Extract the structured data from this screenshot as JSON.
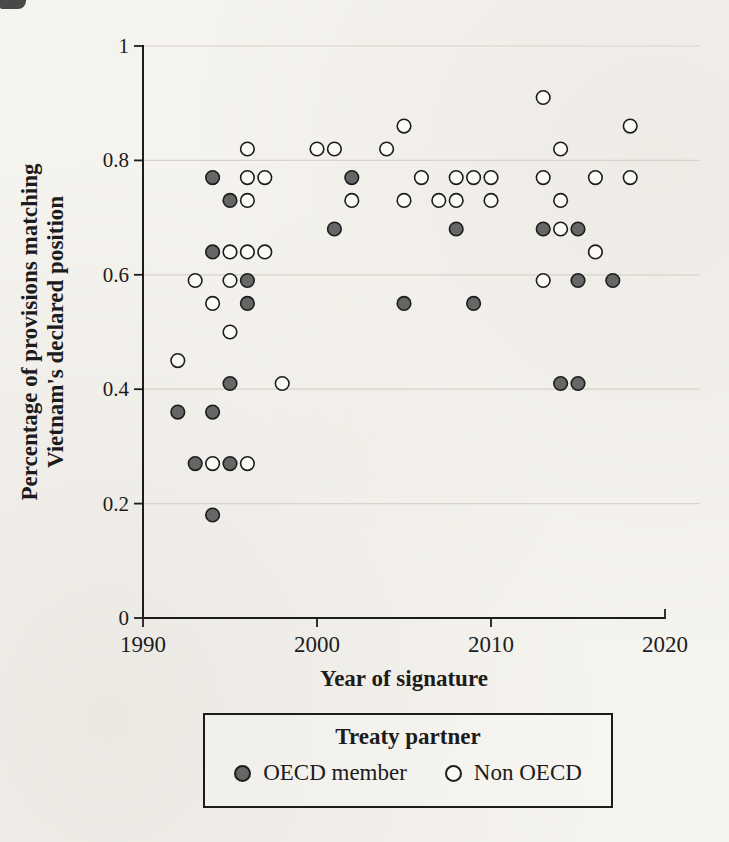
{
  "figure": {
    "background": "#f5f3ee",
    "ink": "#1c1c1c",
    "grid_color": "#d7d4cd",
    "marker_outline": "#1c1c1c"
  },
  "chart_data": {
    "type": "scatter",
    "title": "",
    "xlabel": "Year of signature",
    "ylabel_line1": "Percentage of provisions matching",
    "ylabel_line2": "Vietnam's declared position",
    "xlim": [
      1990,
      2020
    ],
    "ylim": [
      0,
      1
    ],
    "x_ticks": [
      1990,
      2000,
      2010,
      2020
    ],
    "x_tick_labels": [
      "1990",
      "2000",
      "2010",
      "2020"
    ],
    "y_ticks": [
      0,
      0.2,
      0.4,
      0.6,
      0.8,
      1
    ],
    "y_tick_labels": [
      "0",
      "0.2",
      "0.4",
      "0.6",
      "0.8",
      "1"
    ],
    "grid": "horizontal-only",
    "legend": {
      "title": "Treaty partner",
      "position": "below-chart",
      "entries": [
        {
          "label": "OECD member",
          "marker": "filled-circle",
          "fill": "#666666"
        },
        {
          "label": "Non OECD",
          "marker": "open-circle",
          "fill": "#fbfaf6"
        }
      ]
    },
    "series": [
      {
        "name": "OECD member",
        "marker": "filled-circle",
        "marker_fill": "#666666",
        "points": [
          [
            1992,
            0.36
          ],
          [
            1993,
            0.27
          ],
          [
            1994,
            0.77
          ],
          [
            1994,
            0.64
          ],
          [
            1994,
            0.36
          ],
          [
            1994,
            0.18
          ],
          [
            1995,
            0.73
          ],
          [
            1995,
            0.41
          ],
          [
            1995,
            0.27
          ],
          [
            1996,
            0.59
          ],
          [
            1996,
            0.55
          ],
          [
            2001,
            0.68
          ],
          [
            2002,
            0.77
          ],
          [
            2005,
            0.55
          ],
          [
            2008,
            0.68
          ],
          [
            2009,
            0.55
          ],
          [
            2013,
            0.68
          ],
          [
            2014,
            0.41
          ],
          [
            2015,
            0.68
          ],
          [
            2015,
            0.59
          ],
          [
            2015,
            0.41
          ],
          [
            2017,
            0.59
          ]
        ]
      },
      {
        "name": "Non OECD",
        "marker": "open-circle",
        "marker_fill": "#fbfaf6",
        "points": [
          [
            1992,
            0.45
          ],
          [
            1993,
            0.59
          ],
          [
            1994,
            0.55
          ],
          [
            1994,
            0.27
          ],
          [
            1995,
            0.64
          ],
          [
            1995,
            0.59
          ],
          [
            1995,
            0.5
          ],
          [
            1996,
            0.82
          ],
          [
            1996,
            0.77
          ],
          [
            1996,
            0.73
          ],
          [
            1996,
            0.64
          ],
          [
            1996,
            0.27
          ],
          [
            1997,
            0.77
          ],
          [
            1997,
            0.64
          ],
          [
            1998,
            0.41
          ],
          [
            2000,
            0.82
          ],
          [
            2001,
            0.82
          ],
          [
            2002,
            0.73
          ],
          [
            2004,
            0.82
          ],
          [
            2005,
            0.86
          ],
          [
            2005,
            0.73
          ],
          [
            2006,
            0.77
          ],
          [
            2007,
            0.73
          ],
          [
            2008,
            0.77
          ],
          [
            2008,
            0.73
          ],
          [
            2009,
            0.77
          ],
          [
            2010,
            0.77
          ],
          [
            2010,
            0.73
          ],
          [
            2013,
            0.91
          ],
          [
            2013,
            0.77
          ],
          [
            2013,
            0.59
          ],
          [
            2014,
            0.82
          ],
          [
            2014,
            0.73
          ],
          [
            2014,
            0.68
          ],
          [
            2016,
            0.77
          ],
          [
            2016,
            0.64
          ],
          [
            2018,
            0.86
          ],
          [
            2018,
            0.77
          ]
        ]
      }
    ]
  }
}
